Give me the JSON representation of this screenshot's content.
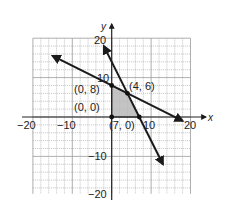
{
  "chart_data": {
    "type": "line",
    "title": "",
    "xlabel": "x",
    "ylabel": "y",
    "xlim": [
      -20,
      20
    ],
    "ylim": [
      -20,
      20
    ],
    "grid": true,
    "grid_step": 2,
    "x_tick_labels": [
      "-20",
      "-10",
      "10",
      "20"
    ],
    "y_tick_labels": [
      "20",
      "10",
      "-10",
      "-20"
    ],
    "series": [
      {
        "name": "line-1",
        "equation": "y = 8 - x/2",
        "from": [
          -15,
          15.5
        ],
        "to": [
          18,
          -1
        ],
        "arrows": "both"
      },
      {
        "name": "line-2",
        "equation": "y = 14 - 2x",
        "from": [
          -2,
          18
        ],
        "to": [
          13,
          -12
        ],
        "arrows": "both"
      }
    ],
    "feasible_region": [
      [
        0,
        0
      ],
      [
        0,
        8
      ],
      [
        4,
        6
      ],
      [
        7,
        0
      ]
    ],
    "points": [
      {
        "x": 0,
        "y": 8,
        "label": "(0, 8)"
      },
      {
        "x": 4,
        "y": 6,
        "label": "(4, 6)"
      },
      {
        "x": 0,
        "y": 0,
        "label": "(0, 0)"
      },
      {
        "x": 7,
        "y": 0,
        "label": "(7, 0)"
      }
    ],
    "colors": {
      "grid": "#9a9a9a",
      "axis": "#222222",
      "line": "#1a1a1a",
      "region": "#b9b9b9"
    }
  },
  "labels": {
    "x_axis": "x",
    "y_axis": "y",
    "x_neg20": "−20",
    "x_neg10": "−10",
    "x_10": "10",
    "x_20": "20",
    "y_20": "20",
    "y_10": "10",
    "y_neg10": "−10",
    "y_neg20": "−20",
    "pt_0_8": "(0, 8)",
    "pt_4_6": "(4, 6)",
    "pt_0_0": "(0, 0)",
    "pt_7_0": "(7, 0)"
  }
}
